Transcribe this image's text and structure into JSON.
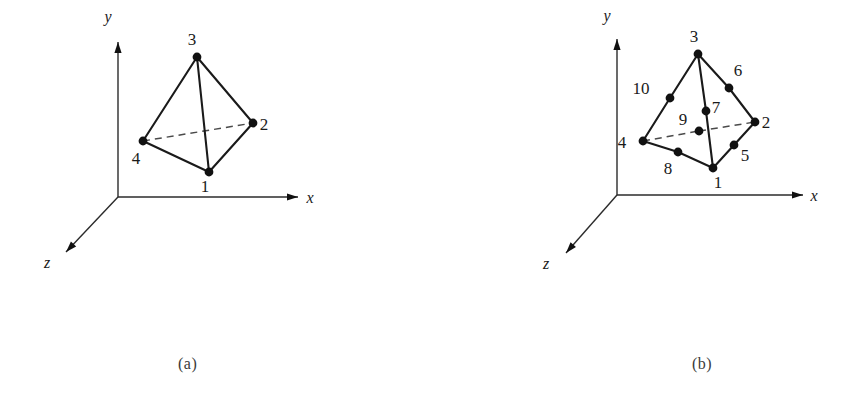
{
  "figure": {
    "background": "#ffffff",
    "ink_color": "#1a1a1a",
    "dashed_color": "#4a4a4a",
    "captions": {
      "a": "(a)",
      "b": "(b)"
    }
  },
  "panel_a": {
    "name": "linear-tetrahedron",
    "axes": {
      "origin": [
        118,
        197
      ],
      "x": {
        "label": "x",
        "tip": [
          298,
          197
        ],
        "label_pos": [
          310,
          203
        ]
      },
      "y": {
        "label": "y",
        "tip": [
          118,
          42
        ],
        "label_pos": [
          108,
          22
        ]
      },
      "z": {
        "label": "z",
        "tip": [
          66,
          252
        ],
        "label_pos": [
          47,
          268
        ]
      }
    },
    "nodes": [
      {
        "id": "1",
        "pos": [
          209,
          172
        ],
        "label_pos": [
          205,
          192
        ]
      },
      {
        "id": "2",
        "pos": [
          253,
          123
        ],
        "label_pos": [
          264,
          130
        ]
      },
      {
        "id": "3",
        "pos": [
          197,
          57
        ],
        "label_pos": [
          192,
          45
        ]
      },
      {
        "id": "4",
        "pos": [
          143,
          141
        ],
        "label_pos": [
          136,
          164
        ]
      }
    ],
    "solid_edges": [
      [
        "3",
        "1"
      ],
      [
        "3",
        "2"
      ],
      [
        "3",
        "4"
      ],
      [
        "4",
        "1"
      ],
      [
        "1",
        "2"
      ]
    ],
    "dashed_edges": [
      [
        "4",
        "2"
      ]
    ]
  },
  "panel_b": {
    "name": "quadratic-tetrahedron",
    "axes": {
      "origin": [
        617,
        195
      ],
      "x": {
        "label": "x",
        "tip": [
          803,
          195
        ],
        "label_pos": [
          814,
          201
        ]
      },
      "y": {
        "label": "y",
        "tip": [
          617,
          39
        ],
        "label_pos": [
          607,
          21
        ]
      },
      "z": {
        "label": "z",
        "tip": [
          566,
          253
        ],
        "label_pos": [
          546,
          269
        ]
      }
    },
    "nodes": [
      {
        "id": "1",
        "pos": [
          713,
          168
        ],
        "label_pos": [
          718,
          188
        ]
      },
      {
        "id": "2",
        "pos": [
          755,
          122
        ],
        "label_pos": [
          766,
          128
        ]
      },
      {
        "id": "3",
        "pos": [
          698,
          54
        ],
        "label_pos": [
          694,
          42
        ]
      },
      {
        "id": "4",
        "pos": [
          643,
          141
        ],
        "label_pos": [
          622,
          148
        ]
      },
      {
        "id": "5",
        "pos": [
          734,
          145
        ],
        "label_pos": [
          745,
          161
        ]
      },
      {
        "id": "6",
        "pos": [
          729,
          88
        ],
        "label_pos": [
          738,
          76
        ]
      },
      {
        "id": "7",
        "pos": [
          706,
          111
        ],
        "label_pos": [
          716,
          113
        ]
      },
      {
        "id": "8",
        "pos": [
          678,
          152
        ],
        "label_pos": [
          668,
          174
        ]
      },
      {
        "id": "9",
        "pos": [
          699,
          131
        ],
        "label_pos": [
          683,
          125
        ]
      },
      {
        "id": "10",
        "pos": [
          670,
          98
        ],
        "label_pos": [
          641,
          94
        ]
      }
    ],
    "solid_edges": [
      [
        "3",
        "7"
      ],
      [
        "7",
        "1"
      ],
      [
        "3",
        "6"
      ],
      [
        "6",
        "2"
      ],
      [
        "3",
        "10"
      ],
      [
        "10",
        "4"
      ],
      [
        "4",
        "8"
      ],
      [
        "8",
        "1"
      ],
      [
        "1",
        "5"
      ],
      [
        "5",
        "2"
      ]
    ],
    "dashed_edges": [
      [
        "4",
        "9"
      ],
      [
        "9",
        "2"
      ]
    ]
  }
}
